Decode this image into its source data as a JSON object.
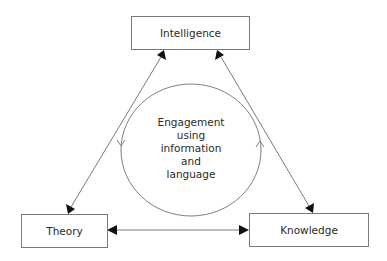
{
  "diagram": {
    "nodes": {
      "top": {
        "label": "Intelligence"
      },
      "left": {
        "label": "Theory"
      },
      "right": {
        "label": "Knowledge"
      }
    },
    "center": {
      "lines": [
        "Engagement",
        "using",
        "information",
        "and",
        "language"
      ]
    },
    "edges": [
      {
        "from": "Intelligence",
        "to": "Theory",
        "type": "bidirectional-arrow"
      },
      {
        "from": "Intelligence",
        "to": "Knowledge",
        "type": "bidirectional-arrow"
      },
      {
        "from": "Theory",
        "to": "Knowledge",
        "type": "bidirectional-arrow"
      }
    ],
    "cycle": {
      "shape": "circle",
      "direction": "counter-clockwise-arrows"
    },
    "colors": {
      "stroke": "#7a7a7a",
      "arrowhead": "#111111",
      "text": "#2a2a2a"
    }
  }
}
